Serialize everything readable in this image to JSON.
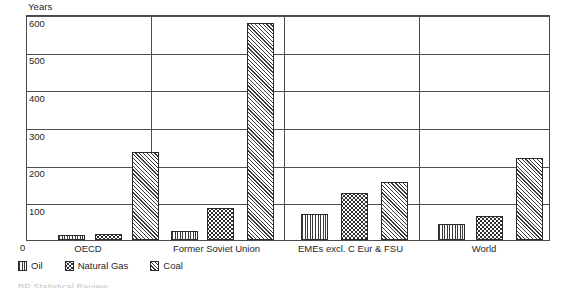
{
  "axis_unit_label": "Years",
  "zero_label": "0",
  "legend": {
    "items": [
      {
        "label": "Oil",
        "pattern": "vertical-lines"
      },
      {
        "label": "Natural Gas",
        "pattern": "dots"
      },
      {
        "label": "Coal",
        "pattern": "diagonal-hatch"
      }
    ]
  },
  "source_note": "BP Statistical Review",
  "chart_data": {
    "type": "bar",
    "title": "",
    "subtitle": "",
    "xlabel": "",
    "ylabel": "Years",
    "ylim": [
      0,
      600
    ],
    "yticks": [
      100,
      200,
      300,
      400,
      500,
      600
    ],
    "ytick_labels": [
      "100",
      "200",
      "300",
      "400",
      "500",
      "600"
    ],
    "grid": true,
    "legend_position": "below-axes-left",
    "group_separators": true,
    "categories": [
      "OECD",
      "Former Soviet Union",
      "EMEs excl. C Eur & FSU",
      "World"
    ],
    "series": [
      {
        "name": "Oil",
        "values": [
          13,
          25,
          70,
          43
        ]
      },
      {
        "name": "Natural Gas",
        "values": [
          17,
          85,
          125,
          65
        ]
      },
      {
        "name": "Coal",
        "values": [
          235,
          575,
          155,
          218
        ]
      }
    ]
  }
}
